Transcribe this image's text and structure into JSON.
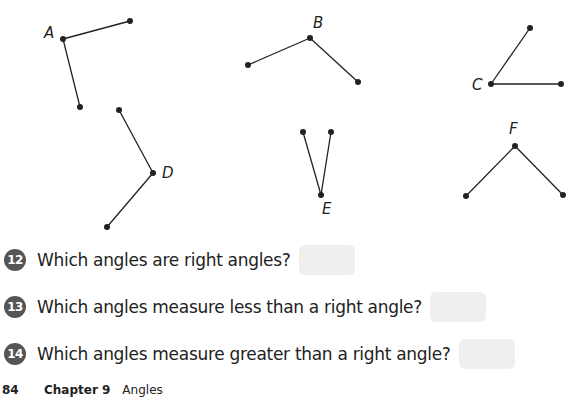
{
  "figure": {
    "angles": [
      {
        "label": "A",
        "vertex": [
          63,
          39
        ],
        "arm1": [
          130,
          21
        ],
        "arm2": [
          80,
          107
        ],
        "label_pos": [
          44,
          26
        ]
      },
      {
        "label": "B",
        "vertex": [
          310,
          38
        ],
        "arm1": [
          248,
          65
        ],
        "arm2": [
          358,
          82
        ],
        "label_pos": [
          313,
          16
        ]
      },
      {
        "label": "C",
        "vertex": [
          491,
          84
        ],
        "arm1": [
          530,
          28
        ],
        "arm2": [
          561,
          84
        ],
        "label_pos": [
          472,
          78
        ]
      },
      {
        "label": "D",
        "vertex": [
          153,
          173
        ],
        "arm1": [
          119,
          110
        ],
        "arm2": [
          107,
          227
        ],
        "label_pos": [
          162,
          166
        ]
      },
      {
        "label": "E",
        "vertex": [
          321,
          195
        ],
        "arm1": [
          303,
          132
        ],
        "arm2": [
          331,
          132
        ],
        "label_pos": [
          322,
          202
        ]
      },
      {
        "label": "F",
        "vertex": [
          515,
          146
        ],
        "arm1": [
          466,
          196
        ],
        "arm2": [
          563,
          195
        ],
        "label_pos": [
          509,
          122
        ]
      }
    ]
  },
  "questions": [
    {
      "number": "12",
      "text": "Which angles are right angles?",
      "answer": ""
    },
    {
      "number": "13",
      "text": "Which angles measure less than a right angle?",
      "answer": ""
    },
    {
      "number": "14",
      "text": "Which angles measure greater than a right angle?",
      "answer": ""
    }
  ],
  "footer": {
    "page_number": "84",
    "chapter": "Chapter 9",
    "chapter_title": "Angles"
  },
  "colors": {
    "ink": "#222222",
    "badge": "#555555",
    "answer_box": "#efefef"
  }
}
